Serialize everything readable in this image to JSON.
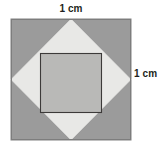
{
  "figure": {
    "labels": {
      "top": "1 cm",
      "right": "1 cm"
    },
    "colors": {
      "outer_square_fill": "#9b9b9b",
      "outer_square_stroke": "#7d7d7d",
      "diamond_fill": "#e8e8e6",
      "diamond_stroke": "#e8e8e6",
      "inner_square_fill": "#b9b9b7",
      "inner_square_stroke": "#3c3a39",
      "background": "#ffffff",
      "label_text": "#231f20"
    },
    "geometry": {
      "outer_square": {
        "x": 11,
        "y": 19,
        "width": 120,
        "height": 121,
        "corners": "11,19 131,19 131,140 11,140"
      },
      "diamond": {
        "points": "71,19 131,79.5 71,140 11,79.5",
        "description": "rotated square with vertices at outer square edge midpoints"
      },
      "inner_square": {
        "x": 40,
        "y": 53,
        "width": 62,
        "height": 60,
        "points": "40,53 102,53 102,113 40,113"
      }
    },
    "dimension_top": {
      "value": 1,
      "unit": "cm",
      "side": "top"
    },
    "dimension_right": {
      "value": 1,
      "unit": "cm",
      "side": "right"
    }
  }
}
